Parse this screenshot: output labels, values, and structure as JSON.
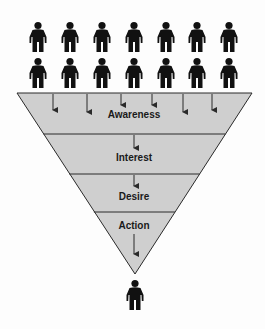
{
  "diagram": {
    "type": "funnel",
    "stages": [
      {
        "label": "Awareness",
        "label_y": 114
      },
      {
        "label": "Interest",
        "label_y": 157
      },
      {
        "label": "Desire",
        "label_y": 196
      },
      {
        "label": "Action",
        "label_y": 229
      }
    ],
    "colors": {
      "funnel_fill": "#cfcfcf",
      "stroke": "#2a2a2a",
      "person": "#111111",
      "background": "#fdfdfd"
    },
    "crowd": {
      "rows": 2,
      "columns": 7
    },
    "output_people": 1
  }
}
